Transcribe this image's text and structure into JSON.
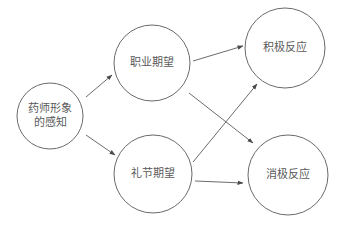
{
  "diagram": {
    "nodes": [
      {
        "id": "perception",
        "lines": [
          "药师形象",
          "的感知"
        ]
      },
      {
        "id": "professional",
        "lines": [
          "职业期望"
        ]
      },
      {
        "id": "etiquette",
        "lines": [
          "礼节期望"
        ]
      },
      {
        "id": "positive",
        "lines": [
          "积极反应"
        ]
      },
      {
        "id": "negative",
        "lines": [
          "消极反应"
        ]
      }
    ],
    "edges": [
      {
        "from": "perception",
        "to": "professional"
      },
      {
        "from": "perception",
        "to": "etiquette"
      },
      {
        "from": "professional",
        "to": "positive"
      },
      {
        "from": "professional",
        "to": "negative"
      },
      {
        "from": "etiquette",
        "to": "positive"
      },
      {
        "from": "etiquette",
        "to": "negative"
      }
    ],
    "colors": {
      "stroke": "#6a6a6a",
      "text": "#5a5a5a",
      "background": "#ffffff"
    }
  }
}
